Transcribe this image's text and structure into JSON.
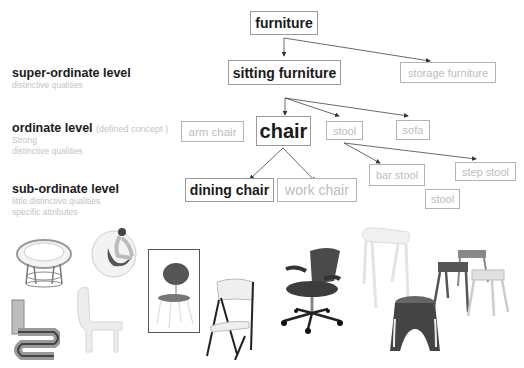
{
  "levels": [
    {
      "title": "super-ordinate level",
      "aside": "",
      "lines": [
        "distinctive qualities"
      ]
    },
    {
      "title": "ordinate level",
      "aside": "(defined concept )",
      "lines": [
        "Strong",
        "distinctive qualities"
      ]
    },
    {
      "title": "sub-ordinate level",
      "aside": "",
      "lines": [
        "little distinctive qualities",
        "specific attributes"
      ]
    }
  ],
  "nodes": {
    "furniture": "furniture",
    "sitting_furniture": "sitting furniture",
    "storage_furniture": "storage furniture",
    "arm_chair": "arm chair",
    "chair": "chair",
    "stool": "stool",
    "sofa": "sofa",
    "dining_chair": "dining chair",
    "work_chair": "work chair",
    "bar_stool": "bar stool",
    "step_stool": "step stool",
    "stool_sub": "stool"
  },
  "colors": {
    "emphasis_text": "#1a1a1a",
    "muted_text": "#bdbdbd",
    "box_border": "#9a9a9a",
    "arrow": "#333333"
  },
  "photos": [
    "papasan-chair",
    "ball-chair",
    "wiggle-chair",
    "plastic-monobloc-chair",
    "shell-dining-chair",
    "folding-chair",
    "mesh-office-chair",
    "white-bar-stool",
    "elephant-stool",
    "stacked-metal-stools"
  ]
}
